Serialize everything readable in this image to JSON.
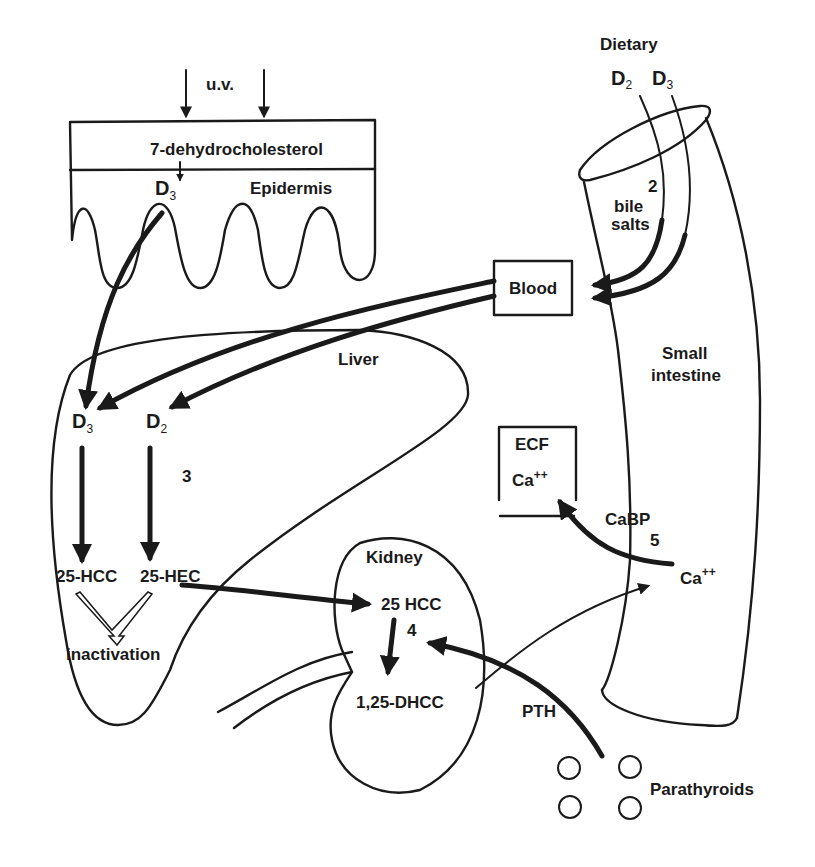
{
  "diagram": {
    "type": "vitamin-d-metabolism-pathway",
    "labels": {
      "uv": "u.v.",
      "dehydrocholesterol": "7-dehydrocholesterol",
      "epidermis": "Epidermis",
      "epidermis_d": "D",
      "epidermis_d_sub": "3",
      "dietary": "Dietary",
      "dietary_d2": "D",
      "dietary_d2_sub": "2",
      "dietary_d3": "D",
      "dietary_d3_sub": "3",
      "step_2": "2",
      "bile": "bile",
      "salts": "salts",
      "blood": "Blood",
      "liver": "Liver",
      "small": "Small",
      "intestine": "intestine",
      "liver_d3": "D",
      "liver_d3_sub": "3",
      "liver_d2": "D",
      "liver_d2_sub": "2",
      "step_3": "3",
      "hcc_25": "25-HCC",
      "hec_25": "25-HEC",
      "inactivation": "inactivation",
      "ecf": "ECF",
      "ecf_ca": "Ca",
      "ecf_ca_sup": "++",
      "cabp": "CaBP",
      "step_5": "5",
      "intestine_ca": "Ca",
      "intestine_ca_sup": "++",
      "kidney": "Kidney",
      "kidney_25hcc": "25 HCC",
      "step_4": "4",
      "dhcc": "1,25-DHCC",
      "pth": "PTH",
      "parathyroids": "Parathyroids"
    },
    "colors": {
      "ink": "#1a1a1a",
      "background": "#ffffff"
    }
  }
}
